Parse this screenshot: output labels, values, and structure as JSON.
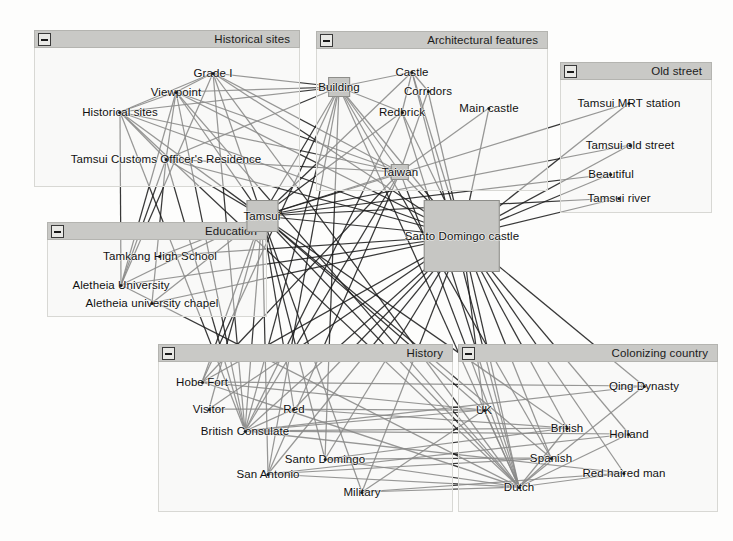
{
  "view": {
    "width": 733,
    "height": 541,
    "background": "#fdfdfc",
    "edge_color": "#1d1d1d",
    "node_box_fill": "#c6c6c3",
    "group_header_fill": "#c9c9c6",
    "group_body_fill": "#f6f6f4"
  },
  "groups": [
    {
      "id": "historical-sites",
      "title": "Historical sites",
      "collapse_icon": "minus-icon",
      "x": 34,
      "y": 30,
      "w": 266,
      "h": 157
    },
    {
      "id": "architectural-features",
      "title": "Architectural features",
      "collapse_icon": "minus-icon",
      "x": 316,
      "y": 31,
      "w": 232,
      "h": 160
    },
    {
      "id": "old-street",
      "title": "Old street",
      "collapse_icon": "minus-icon",
      "x": 560,
      "y": 62,
      "w": 152,
      "h": 151
    },
    {
      "id": "education",
      "title": "Education",
      "collapse_icon": "minus-icon",
      "x": 47,
      "y": 222,
      "w": 220,
      "h": 95
    },
    {
      "id": "history",
      "title": "History",
      "collapse_icon": "minus-icon",
      "x": 158,
      "y": 344,
      "w": 295,
      "h": 168
    },
    {
      "id": "colonizing-country",
      "title": "Colonizing country",
      "collapse_icon": "minus-icon",
      "x": 458,
      "y": 344,
      "w": 260,
      "h": 168
    }
  ],
  "nodes": [
    {
      "id": "grade-i",
      "label": "Grade I",
      "group": "historical-sites",
      "x": 213,
      "y": 73,
      "shape": "dot"
    },
    {
      "id": "viewpoint",
      "label": "Viewpoint",
      "group": "historical-sites",
      "x": 176,
      "y": 92,
      "shape": "dot"
    },
    {
      "id": "historical-sites-node",
      "label": "Historical sites",
      "group": "historical-sites",
      "x": 120,
      "y": 112,
      "shape": "dot"
    },
    {
      "id": "tamsui-customs",
      "label": "Tamsui Customs Officer's Residence",
      "group": "historical-sites",
      "x": 166,
      "y": 159,
      "shape": "dot"
    },
    {
      "id": "building",
      "label": "Building",
      "group": "architectural-features",
      "x": 339,
      "y": 87,
      "shape": "box",
      "box_w": 22,
      "box_h": 20
    },
    {
      "id": "castle",
      "label": "Castle",
      "group": "architectural-features",
      "x": 412,
      "y": 72,
      "shape": "dot"
    },
    {
      "id": "corridors",
      "label": "Corridors",
      "group": "architectural-features",
      "x": 428,
      "y": 91,
      "shape": "dot"
    },
    {
      "id": "redbrick",
      "label": "Redbrick",
      "group": "architectural-features",
      "x": 402,
      "y": 112,
      "shape": "dot"
    },
    {
      "id": "main-castle",
      "label": "Main castle",
      "group": "architectural-features",
      "x": 489,
      "y": 108,
      "shape": "dot"
    },
    {
      "id": "taiwan",
      "label": "Taiwan",
      "group": "architectural-features",
      "x": 400,
      "y": 172,
      "shape": "box",
      "box_w": 18,
      "box_h": 16
    },
    {
      "id": "tamsui-mrt",
      "label": "Tamsui MRT station",
      "group": "old-street",
      "x": 629,
      "y": 103,
      "shape": "dot"
    },
    {
      "id": "tamsui-old-street",
      "label": "Tamsui old street",
      "group": "old-street",
      "x": 630,
      "y": 145,
      "shape": "dot"
    },
    {
      "id": "beautiful",
      "label": "Beautiful",
      "group": "old-street",
      "x": 611,
      "y": 174,
      "shape": "dot"
    },
    {
      "id": "tamsui-river",
      "label": "Tamsui river",
      "group": "old-street",
      "x": 619,
      "y": 198,
      "shape": "dot"
    },
    {
      "id": "tamkang-high",
      "label": "Tamkang High School",
      "group": "education",
      "x": 160,
      "y": 256,
      "shape": "dot"
    },
    {
      "id": "aletheia-univ",
      "label": "Aletheia University",
      "group": "education",
      "x": 121,
      "y": 285,
      "shape": "dot"
    },
    {
      "id": "aletheia-chapel",
      "label": "Aletheia university chapel",
      "group": "education",
      "x": 152,
      "y": 303,
      "shape": "dot"
    },
    {
      "id": "tamsui",
      "label": "Tamsui",
      "group": null,
      "x": 262,
      "y": 216,
      "shape": "box",
      "box_w": 32,
      "box_h": 32
    },
    {
      "id": "santo-domingo-castle",
      "label": "Santo Domingo castle",
      "group": null,
      "x": 462,
      "y": 236,
      "shape": "box",
      "box_w": 76,
      "box_h": 72
    },
    {
      "id": "hobe-fort",
      "label": "Hobe Fort",
      "group": "history",
      "x": 202,
      "y": 382,
      "shape": "dot"
    },
    {
      "id": "visitor",
      "label": "Visitor",
      "group": "history",
      "x": 209,
      "y": 409,
      "shape": "dot"
    },
    {
      "id": "red",
      "label": "Red",
      "group": "history",
      "x": 294,
      "y": 409,
      "shape": "dot"
    },
    {
      "id": "british-consulate",
      "label": "British Consulate",
      "group": "history",
      "x": 245,
      "y": 431,
      "shape": "dot"
    },
    {
      "id": "santo-domingo",
      "label": "Santo Domingo",
      "group": "history",
      "x": 325,
      "y": 459,
      "shape": "dot"
    },
    {
      "id": "san-antonio",
      "label": "San Antonio",
      "group": "history",
      "x": 268,
      "y": 474,
      "shape": "dot"
    },
    {
      "id": "military",
      "label": "Military",
      "group": "history",
      "x": 362,
      "y": 492,
      "shape": "dot"
    },
    {
      "id": "qing-dynasty",
      "label": "Qing Dynasty",
      "group": "colonizing-country",
      "x": 644,
      "y": 386,
      "shape": "dot"
    },
    {
      "id": "uk",
      "label": "UK",
      "group": "colonizing-country",
      "x": 484,
      "y": 410,
      "shape": "dot"
    },
    {
      "id": "british",
      "label": "British",
      "group": "colonizing-country",
      "x": 567,
      "y": 428,
      "shape": "dot"
    },
    {
      "id": "holland",
      "label": "Holland",
      "group": "colonizing-country",
      "x": 629,
      "y": 434,
      "shape": "dot"
    },
    {
      "id": "spanish",
      "label": "Spanish",
      "group": "colonizing-country",
      "x": 551,
      "y": 458,
      "shape": "dot"
    },
    {
      "id": "red-haired-man",
      "label": "Red haired man",
      "group": "colonizing-country",
      "x": 624,
      "y": 473,
      "shape": "dot"
    },
    {
      "id": "dutch",
      "label": "Dutch",
      "group": "colonizing-country",
      "x": 519,
      "y": 487,
      "shape": "dot"
    }
  ],
  "edges": [
    [
      "tamsui",
      "grade-i"
    ],
    [
      "tamsui",
      "viewpoint"
    ],
    [
      "tamsui",
      "historical-sites-node"
    ],
    [
      "tamsui",
      "tamsui-customs"
    ],
    [
      "tamsui",
      "building"
    ],
    [
      "tamsui",
      "castle"
    ],
    [
      "tamsui",
      "redbrick"
    ],
    [
      "tamsui",
      "taiwan"
    ],
    [
      "tamsui",
      "tamsui-mrt"
    ],
    [
      "tamsui",
      "tamsui-old-street"
    ],
    [
      "tamsui",
      "beautiful"
    ],
    [
      "tamsui",
      "tamsui-river"
    ],
    [
      "tamsui",
      "tamkang-high"
    ],
    [
      "tamsui",
      "aletheia-univ"
    ],
    [
      "tamsui",
      "aletheia-chapel"
    ],
    [
      "tamsui",
      "hobe-fort"
    ],
    [
      "tamsui",
      "visitor"
    ],
    [
      "tamsui",
      "red"
    ],
    [
      "tamsui",
      "british-consulate"
    ],
    [
      "tamsui",
      "santo-domingo"
    ],
    [
      "tamsui",
      "san-antonio"
    ],
    [
      "tamsui",
      "military"
    ],
    [
      "tamsui",
      "uk"
    ],
    [
      "tamsui",
      "british"
    ],
    [
      "tamsui",
      "spanish"
    ],
    [
      "tamsui",
      "dutch"
    ],
    [
      "tamsui",
      "santo-domingo-castle"
    ],
    [
      "santo-domingo-castle",
      "grade-i"
    ],
    [
      "santo-domingo-castle",
      "viewpoint"
    ],
    [
      "santo-domingo-castle",
      "historical-sites-node"
    ],
    [
      "santo-domingo-castle",
      "tamsui-customs"
    ],
    [
      "santo-domingo-castle",
      "building"
    ],
    [
      "santo-domingo-castle",
      "castle"
    ],
    [
      "santo-domingo-castle",
      "corridors"
    ],
    [
      "santo-domingo-castle",
      "redbrick"
    ],
    [
      "santo-domingo-castle",
      "main-castle"
    ],
    [
      "santo-domingo-castle",
      "taiwan"
    ],
    [
      "santo-domingo-castle",
      "tamsui-mrt"
    ],
    [
      "santo-domingo-castle",
      "tamsui-old-street"
    ],
    [
      "santo-domingo-castle",
      "beautiful"
    ],
    [
      "santo-domingo-castle",
      "tamsui-river"
    ],
    [
      "santo-domingo-castle",
      "tamkang-high"
    ],
    [
      "santo-domingo-castle",
      "aletheia-univ"
    ],
    [
      "santo-domingo-castle",
      "aletheia-chapel"
    ],
    [
      "santo-domingo-castle",
      "hobe-fort"
    ],
    [
      "santo-domingo-castle",
      "visitor"
    ],
    [
      "santo-domingo-castle",
      "red"
    ],
    [
      "santo-domingo-castle",
      "british-consulate"
    ],
    [
      "santo-domingo-castle",
      "santo-domingo"
    ],
    [
      "santo-domingo-castle",
      "san-antonio"
    ],
    [
      "santo-domingo-castle",
      "military"
    ],
    [
      "santo-domingo-castle",
      "qing-dynasty"
    ],
    [
      "santo-domingo-castle",
      "uk"
    ],
    [
      "santo-domingo-castle",
      "british"
    ],
    [
      "santo-domingo-castle",
      "holland"
    ],
    [
      "santo-domingo-castle",
      "spanish"
    ],
    [
      "santo-domingo-castle",
      "red-haired-man"
    ],
    [
      "santo-domingo-castle",
      "dutch"
    ],
    [
      "building",
      "grade-i"
    ],
    [
      "building",
      "viewpoint"
    ],
    [
      "building",
      "historical-sites-node"
    ],
    [
      "building",
      "tamsui-customs"
    ],
    [
      "building",
      "castle"
    ],
    [
      "building",
      "redbrick"
    ],
    [
      "building",
      "taiwan"
    ],
    [
      "building",
      "british-consulate"
    ],
    [
      "building",
      "hobe-fort"
    ],
    [
      "building",
      "san-antonio"
    ],
    [
      "building",
      "dutch"
    ],
    [
      "building",
      "spanish"
    ],
    [
      "building",
      "santo-domingo"
    ],
    [
      "british-consulate",
      "grade-i"
    ],
    [
      "british-consulate",
      "viewpoint"
    ],
    [
      "british-consulate",
      "historical-sites-node"
    ],
    [
      "british-consulate",
      "tamsui-customs"
    ],
    [
      "british-consulate",
      "redbrick"
    ],
    [
      "british-consulate",
      "taiwan"
    ],
    [
      "british-consulate",
      "red"
    ],
    [
      "british-consulate",
      "uk"
    ],
    [
      "british-consulate",
      "british"
    ],
    [
      "british-consulate",
      "holland"
    ],
    [
      "british-consulate",
      "qing-dynasty"
    ],
    [
      "british-consulate",
      "red-haired-man"
    ],
    [
      "dutch",
      "grade-i"
    ],
    [
      "dutch",
      "viewpoint"
    ],
    [
      "dutch",
      "historical-sites-node"
    ],
    [
      "dutch",
      "taiwan"
    ],
    [
      "dutch",
      "redbrick"
    ],
    [
      "dutch",
      "castle"
    ],
    [
      "dutch",
      "spanish"
    ],
    [
      "dutch",
      "british"
    ],
    [
      "dutch",
      "uk"
    ],
    [
      "dutch",
      "holland"
    ],
    [
      "dutch",
      "qing-dynasty"
    ],
    [
      "dutch",
      "red-haired-man"
    ],
    [
      "dutch",
      "san-antonio"
    ],
    [
      "dutch",
      "santo-domingo"
    ],
    [
      "dutch",
      "military"
    ],
    [
      "dutch",
      "hobe-fort"
    ],
    [
      "dutch",
      "aletheia-univ"
    ],
    [
      "taiwan",
      "historical-sites-node"
    ],
    [
      "taiwan",
      "tamsui-customs"
    ],
    [
      "taiwan",
      "viewpoint"
    ],
    [
      "taiwan",
      "grade-i"
    ],
    [
      "taiwan",
      "san-antonio"
    ],
    [
      "taiwan",
      "hobe-fort"
    ],
    [
      "aletheia-univ",
      "viewpoint"
    ],
    [
      "aletheia-univ",
      "grade-i"
    ],
    [
      "aletheia-univ",
      "historical-sites-node"
    ],
    [
      "aletheia-univ",
      "tamsui-customs"
    ],
    [
      "aletheia-chapel",
      "tamsui-customs"
    ],
    [
      "historical-sites-node",
      "tamsui-customs"
    ],
    [
      "historical-sites-node",
      "viewpoint"
    ],
    [
      "historical-sites-node",
      "grade-i"
    ],
    [
      "viewpoint",
      "grade-i"
    ],
    [
      "viewpoint",
      "tamsui-customs"
    ],
    [
      "castle",
      "redbrick"
    ],
    [
      "castle",
      "corridors"
    ],
    [
      "main-castle",
      "taiwan"
    ],
    [
      "corridors",
      "taiwan"
    ],
    [
      "spanish",
      "san-antonio"
    ],
    [
      "spanish",
      "santo-domingo"
    ],
    [
      "uk",
      "hobe-fort"
    ],
    [
      "uk",
      "visitor"
    ],
    [
      "british",
      "red"
    ],
    [
      "qing-dynasty",
      "hobe-fort"
    ],
    [
      "red-haired-man",
      "military"
    ],
    [
      "holland",
      "san-antonio"
    ],
    [
      "military",
      "uk"
    ],
    [
      "santo-domingo",
      "british"
    ]
  ]
}
